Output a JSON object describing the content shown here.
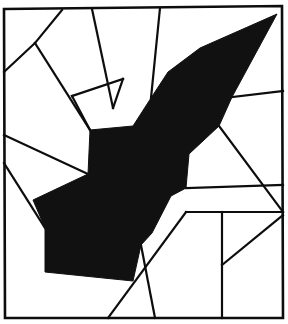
{
  "figure": {
    "type": "line-art",
    "canvas": {
      "width": 288,
      "height": 324
    },
    "colors": {
      "background": "#ffffff",
      "stroke": "#0d0d0d",
      "fill": "#111111"
    },
    "stroke_width": 2.2,
    "frame": {
      "name": "outer-border",
      "points": [
        [
          4,
          9
        ],
        [
          282,
          6
        ],
        [
          283,
          318
        ],
        [
          5,
          318
        ]
      ],
      "stroke_width": 2.6
    },
    "black_shape": {
      "name": "filled-arrow-polygon",
      "fill": "#111111",
      "points": [
        [
          277,
          14
        ],
        [
          232,
          97
        ],
        [
          219,
          126
        ],
        [
          189,
          154
        ],
        [
          186,
          188
        ],
        [
          171,
          196
        ],
        [
          152,
          233
        ],
        [
          141,
          245
        ],
        [
          133,
          281
        ],
        [
          45,
          272
        ],
        [
          45,
          228
        ],
        [
          33,
          200
        ],
        [
          88,
          174
        ],
        [
          90,
          130
        ],
        [
          133,
          126
        ],
        [
          151,
          98
        ],
        [
          168,
          72
        ],
        [
          200,
          48
        ]
      ]
    },
    "lines": [
      {
        "name": "line-top-left-diagonal",
        "points": [
          [
            62,
            10
          ],
          [
            35,
            43
          ]
        ]
      },
      {
        "name": "line-left-upper",
        "points": [
          [
            35,
            43
          ],
          [
            4,
            72
          ]
        ]
      },
      {
        "name": "line-mid-upper-diagonal",
        "points": [
          [
            35,
            43
          ],
          [
            90,
            130
          ]
        ]
      },
      {
        "name": "line-top-second-vertical",
        "points": [
          [
            92,
            9
          ],
          [
            113,
            108
          ]
        ]
      },
      {
        "name": "line-top-third",
        "points": [
          [
            160,
            8
          ],
          [
            151,
            98
          ]
        ]
      },
      {
        "name": "line-upper-cell-divider",
        "points": [
          [
            113,
            108
          ],
          [
            123,
            79
          ]
        ]
      },
      {
        "name": "line-inner-quad-left",
        "points": [
          [
            123,
            79
          ],
          [
            72,
            96
          ]
        ]
      },
      {
        "name": "line-inner-quad-bottom",
        "points": [
          [
            72,
            96
          ],
          [
            90,
            130
          ]
        ]
      },
      {
        "name": "line-left-mid-to-shape",
        "points": [
          [
            4,
            135
          ],
          [
            88,
            174
          ]
        ]
      },
      {
        "name": "line-left-lower-diagonal",
        "points": [
          [
            4,
            163
          ],
          [
            45,
            228
          ]
        ]
      },
      {
        "name": "line-right-upper-from-shape",
        "points": [
          [
            232,
            97
          ],
          [
            283,
            91
          ]
        ]
      },
      {
        "name": "line-right-mid-diagonal",
        "points": [
          [
            219,
            126
          ],
          [
            283,
            212
          ]
        ]
      },
      {
        "name": "line-right-horizontal",
        "points": [
          [
            186,
            188
          ],
          [
            283,
            185
          ]
        ]
      },
      {
        "name": "line-lower-right-horizontal",
        "points": [
          [
            186,
            212
          ],
          [
            283,
            212
          ]
        ]
      },
      {
        "name": "line-lower-right-vertical",
        "points": [
          [
            222,
            212
          ],
          [
            222,
            318
          ]
        ]
      },
      {
        "name": "line-lower-right-diagonal",
        "points": [
          [
            222,
            265
          ],
          [
            283,
            215
          ]
        ]
      },
      {
        "name": "line-bottom-mid-diagonal",
        "points": [
          [
            186,
            212
          ],
          [
            108,
            318
          ]
        ]
      },
      {
        "name": "line-bottom-notch-diagonal",
        "points": [
          [
            141,
            245
          ],
          [
            155,
            318
          ]
        ]
      }
    ]
  }
}
